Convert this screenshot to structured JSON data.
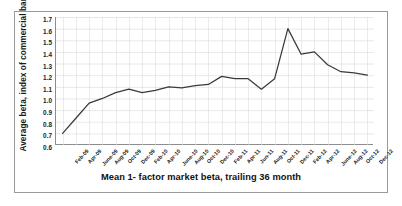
{
  "chart_data": {
    "type": "line",
    "title": "Mean 1- factor market beta, trailing 36 month",
    "xlabel": "",
    "ylabel": "Average beta, index of commercial banks",
    "ylim": [
      0.6,
      1.7
    ],
    "ytick_step": 0.1,
    "yticks": [
      "1.7",
      "1.6",
      "1.5",
      "1.4",
      "1.3",
      "1.2",
      "1.1",
      "1.0",
      "0.9",
      "0.8",
      "0.7",
      "0.6"
    ],
    "grid": true,
    "legend": "none",
    "line_color": "#3a3a3a",
    "categories": [
      "Feb-09",
      "Apr-09",
      "June-09",
      "Aug-09",
      "Oct-09",
      "Dec-09",
      "Feb-10",
      "Apr-10",
      "June-10",
      "Aug-10",
      "Oct-10",
      "Dec-10",
      "Feb-11",
      "Apr-11",
      "Jun-11",
      "Aug-11",
      "Oct-11",
      "Dec-11",
      "Feb-12",
      "Apr-12",
      "June-12",
      "Aug-12",
      "Oct-12",
      "Dec-12"
    ],
    "values": [
      0.7,
      0.83,
      0.96,
      1.0,
      1.05,
      1.08,
      1.05,
      1.07,
      1.1,
      1.09,
      1.11,
      1.12,
      1.19,
      1.17,
      1.17,
      1.08,
      1.17,
      1.6,
      1.38,
      1.4,
      1.29,
      1.23,
      1.22,
      1.2
    ],
    "series": [
      {
        "name": "Mean 1-factor market beta",
        "values": [
          0.7,
          0.83,
          0.96,
          1.0,
          1.05,
          1.08,
          1.05,
          1.07,
          1.1,
          1.09,
          1.11,
          1.12,
          1.19,
          1.17,
          1.17,
          1.08,
          1.17,
          1.6,
          1.38,
          1.4,
          1.29,
          1.23,
          1.22,
          1.2
        ]
      }
    ]
  }
}
